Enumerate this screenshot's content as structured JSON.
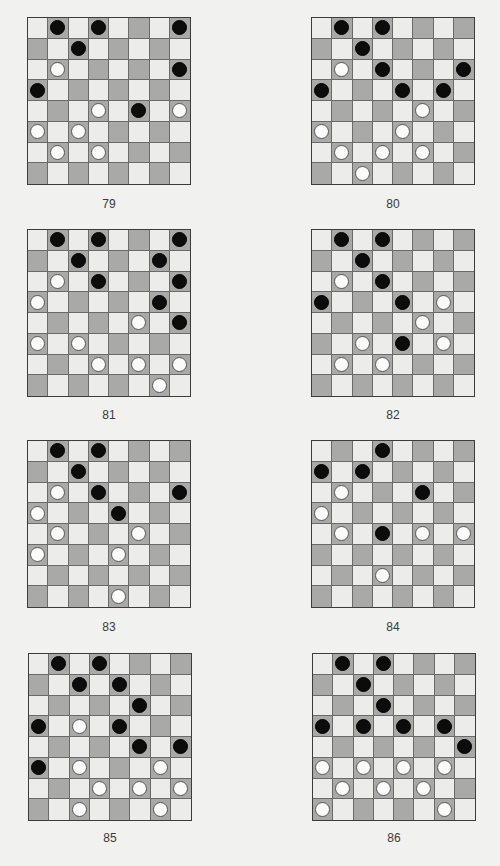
{
  "page": {
    "colors": {
      "background": "#f1f1ef",
      "light_square": "#ececeb",
      "dark_square": "#a9a9a8",
      "black_piece": "#0c0c0c",
      "white_piece": "#fbfbfb"
    },
    "board_size": 8
  },
  "puzzles": [
    {
      "label": "79",
      "black": [
        [
          0,
          1
        ],
        [
          0,
          3
        ],
        [
          0,
          7
        ],
        [
          1,
          2
        ],
        [
          2,
          7
        ],
        [
          3,
          0
        ],
        [
          4,
          5
        ]
      ],
      "white": [
        [
          2,
          1
        ],
        [
          4,
          3
        ],
        [
          4,
          7
        ],
        [
          5,
          0
        ],
        [
          5,
          2
        ],
        [
          6,
          1
        ],
        [
          6,
          3
        ]
      ]
    },
    {
      "label": "80",
      "black": [
        [
          0,
          1
        ],
        [
          0,
          3
        ],
        [
          1,
          2
        ],
        [
          2,
          3
        ],
        [
          2,
          7
        ],
        [
          3,
          0
        ],
        [
          3,
          4
        ],
        [
          3,
          6
        ]
      ],
      "white": [
        [
          2,
          1
        ],
        [
          4,
          5
        ],
        [
          5,
          0
        ],
        [
          5,
          4
        ],
        [
          6,
          1
        ],
        [
          6,
          3
        ],
        [
          6,
          5
        ],
        [
          7,
          2
        ]
      ]
    },
    {
      "label": "81",
      "black": [
        [
          0,
          1
        ],
        [
          0,
          3
        ],
        [
          0,
          7
        ],
        [
          1,
          2
        ],
        [
          1,
          6
        ],
        [
          2,
          3
        ],
        [
          2,
          7
        ],
        [
          3,
          6
        ],
        [
          4,
          7
        ]
      ],
      "white": [
        [
          2,
          1
        ],
        [
          3,
          0
        ],
        [
          4,
          5
        ],
        [
          5,
          0
        ],
        [
          5,
          2
        ],
        [
          6,
          3
        ],
        [
          6,
          5
        ],
        [
          6,
          7
        ],
        [
          7,
          6
        ]
      ]
    },
    {
      "label": "82",
      "black": [
        [
          0,
          1
        ],
        [
          0,
          3
        ],
        [
          1,
          2
        ],
        [
          2,
          3
        ],
        [
          3,
          0
        ],
        [
          3,
          4
        ],
        [
          5,
          4
        ]
      ],
      "white": [
        [
          2,
          1
        ],
        [
          3,
          6
        ],
        [
          4,
          5
        ],
        [
          5,
          2
        ],
        [
          5,
          6
        ],
        [
          6,
          1
        ],
        [
          6,
          3
        ]
      ]
    },
    {
      "label": "83",
      "black": [
        [
          0,
          1
        ],
        [
          0,
          3
        ],
        [
          1,
          2
        ],
        [
          2,
          3
        ],
        [
          2,
          7
        ],
        [
          3,
          4
        ]
      ],
      "white": [
        [
          2,
          1
        ],
        [
          3,
          0
        ],
        [
          4,
          1
        ],
        [
          4,
          5
        ],
        [
          5,
          0
        ],
        [
          5,
          4
        ],
        [
          7,
          4
        ]
      ]
    },
    {
      "label": "84",
      "black": [
        [
          0,
          3
        ],
        [
          1,
          0
        ],
        [
          1,
          2
        ],
        [
          2,
          5
        ],
        [
          4,
          3
        ]
      ],
      "white": [
        [
          2,
          1
        ],
        [
          3,
          0
        ],
        [
          4,
          1
        ],
        [
          4,
          5
        ],
        [
          4,
          7
        ],
        [
          6,
          3
        ]
      ]
    },
    {
      "label": "85",
      "black": [
        [
          0,
          1
        ],
        [
          0,
          3
        ],
        [
          1,
          2
        ],
        [
          1,
          4
        ],
        [
          2,
          5
        ],
        [
          3,
          0
        ],
        [
          3,
          4
        ],
        [
          4,
          5
        ],
        [
          4,
          7
        ],
        [
          5,
          0
        ]
      ],
      "white": [
        [
          3,
          2
        ],
        [
          5,
          2
        ],
        [
          5,
          6
        ],
        [
          6,
          3
        ],
        [
          6,
          5
        ],
        [
          6,
          7
        ],
        [
          7,
          2
        ],
        [
          7,
          6
        ]
      ]
    },
    {
      "label": "86",
      "black": [
        [
          0,
          1
        ],
        [
          0,
          3
        ],
        [
          1,
          2
        ],
        [
          2,
          3
        ],
        [
          3,
          0
        ],
        [
          3,
          2
        ],
        [
          3,
          4
        ],
        [
          3,
          6
        ],
        [
          4,
          7
        ]
      ],
      "white": [
        [
          5,
          0
        ],
        [
          5,
          2
        ],
        [
          5,
          4
        ],
        [
          5,
          6
        ],
        [
          6,
          1
        ],
        [
          6,
          3
        ],
        [
          6,
          5
        ],
        [
          7,
          0
        ],
        [
          7,
          6
        ]
      ]
    }
  ]
}
